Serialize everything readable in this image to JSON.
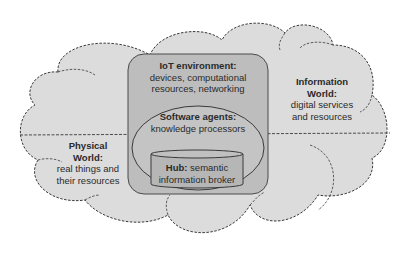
{
  "diagram": {
    "colors": {
      "background": "#ffffff",
      "cloud_fill": "#dcdcdc",
      "cloud_outline": "#3a3a3a",
      "iot_box_fill": "#bdbdbd",
      "agents_ellipse_fill": "#c4c4c4",
      "hub_cylinder_fill": "#b6b6b6",
      "text": "#2a2a2a"
    },
    "iot_environment": {
      "title": "IoT environment:",
      "line1": "devices, computational",
      "line2": "resources, networking"
    },
    "software_agents": {
      "title": "Software agents:",
      "line1": "knowledge processors"
    },
    "hub": {
      "title": "Hub:",
      "line1_rest": " semantic",
      "line2": "information broker"
    },
    "information_world": {
      "title1": "Information",
      "title2": "World:",
      "line1": "digital services",
      "line2": "and resources"
    },
    "physical_world": {
      "title1": "Physical",
      "title2": "World:",
      "line1": "real things and",
      "line2": "their resources"
    }
  }
}
